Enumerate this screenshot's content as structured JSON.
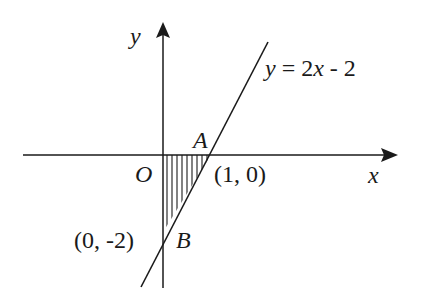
{
  "diagram": {
    "axes": {
      "x_label": "x",
      "y_label": "y",
      "origin_label": "O"
    },
    "line": {
      "equation_y": "y",
      "equation_eq": " = 2",
      "equation_x": "x",
      "equation_rest": " - 2"
    },
    "points": {
      "A": {
        "label": "A",
        "coords": "(1, 0)"
      },
      "B": {
        "label": "B",
        "coords": "(0, -2)"
      }
    },
    "shaded_region": "triangle OAB (vertical hatching)",
    "colors": {
      "ink": "#1a1a1a",
      "background": "#ffffff"
    }
  }
}
